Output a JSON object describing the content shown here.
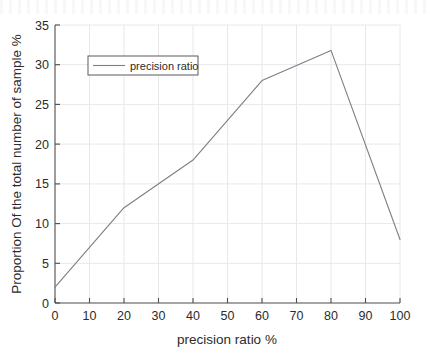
{
  "chart_data": {
    "type": "line",
    "title": "",
    "xlabel": "precision ratio %",
    "ylabel": "Proportion Of the total number of sample %",
    "xlim": [
      0,
      100
    ],
    "ylim": [
      0,
      35
    ],
    "xticks": [
      "0",
      "10",
      "20",
      "30",
      "40",
      "50",
      "60",
      "70",
      "80",
      "90",
      "100"
    ],
    "yticks": [
      "0",
      "5",
      "10",
      "15",
      "20",
      "25",
      "30",
      "35"
    ],
    "grid": true,
    "legend_position": "upper-left",
    "series": [
      {
        "name": "precision ratio",
        "color": "#7a7f87",
        "x": [
          0,
          20,
          40,
          60,
          80,
          100
        ],
        "values": [
          2,
          12,
          18,
          28,
          31.8,
          8
        ]
      }
    ]
  },
  "legend": {
    "entries": [
      {
        "label": "precision ratio"
      }
    ]
  },
  "axes": {
    "x_title": "precision ratio %",
    "y_title": "Proportion Of the total number of sample %",
    "x_tick_labels": [
      "0",
      "10",
      "20",
      "30",
      "40",
      "50",
      "60",
      "70",
      "80",
      "90",
      "100"
    ],
    "y_tick_labels": [
      "0",
      "5",
      "10",
      "15",
      "20",
      "25",
      "30",
      "35"
    ]
  },
  "colors": {
    "line": "#7a7f87",
    "axis": "#4d4d4d",
    "grid": "#e8e8ea",
    "text": "#2b2b2b",
    "background": "#ffffff"
  }
}
